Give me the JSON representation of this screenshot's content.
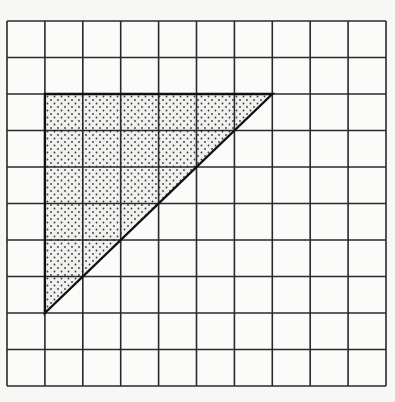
{
  "figure": {
    "grid": {
      "columns": 10,
      "rows": 10,
      "origin_x": 7,
      "origin_y": 21,
      "width": 379,
      "height": 365,
      "line_color": "#2a2a2a",
      "background": "#fbfbf9"
    },
    "triangle": {
      "vertices_grid": [
        [
          1,
          2
        ],
        [
          7,
          2
        ],
        [
          1,
          8
        ]
      ],
      "fill_pattern": "dots",
      "dot_color": "#3a3a3a",
      "fill_background": "#f0f0ee",
      "edge_color": "#111111"
    }
  }
}
